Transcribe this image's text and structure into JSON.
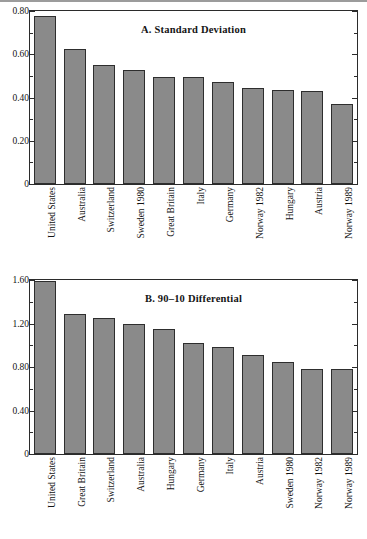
{
  "figure": {
    "background": "#ffffff",
    "bar_color": "#8a8a8a",
    "bar_edge_color": "#2e2e2e",
    "axis_color": "#2b2b2b"
  },
  "chart_data": [
    {
      "type": "bar",
      "title": "A. Standard Deviation",
      "xlabel": "",
      "ylabel": "",
      "ylim": [
        0,
        0.8
      ],
      "ytick_labels": [
        "0",
        "0.20",
        "0.40",
        "0.60",
        "0.80"
      ],
      "ytick_values": [
        0,
        0.2,
        0.4,
        0.6,
        0.8
      ],
      "minor_ticks": true,
      "grid": false,
      "legend": "none",
      "categories": [
        "United States",
        "Australia",
        "Switzerland",
        "Sweden 1980",
        "Great Britain",
        "Italy",
        "Germany",
        "Norway 1982",
        "Hungary",
        "Austria",
        "Norway 1989"
      ],
      "values": [
        0.775,
        0.623,
        0.551,
        0.525,
        0.495,
        0.495,
        0.472,
        0.444,
        0.436,
        0.428,
        0.372
      ]
    },
    {
      "type": "bar",
      "title": "B. 90–10 Differential",
      "xlabel": "",
      "ylabel": "",
      "ylim": [
        0,
        1.6
      ],
      "ytick_labels": [
        "0",
        "0.40",
        "0.80",
        "1.20",
        "1.60"
      ],
      "ytick_values": [
        0,
        0.4,
        0.8,
        1.2,
        1.6
      ],
      "minor_ticks": true,
      "grid": false,
      "legend": "none",
      "categories": [
        "United States",
        "Great Britain",
        "Switzerland",
        "Australia",
        "Hungary",
        "Germany",
        "Italy",
        "Austria",
        "Sweden 1980",
        "Norway 1982",
        "Norway 1989"
      ],
      "values": [
        1.595,
        1.29,
        1.25,
        1.195,
        1.15,
        1.02,
        0.985,
        0.915,
        0.845,
        0.785,
        0.783
      ]
    }
  ]
}
